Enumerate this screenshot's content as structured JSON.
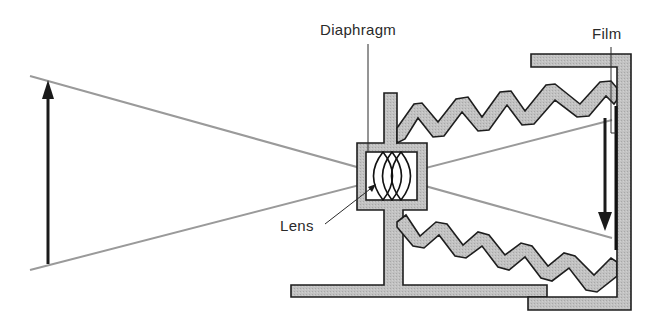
{
  "diagram": {
    "labels": {
      "diaphragm": "Diaphragm",
      "film": "Film",
      "lens": "Lens"
    },
    "elements": {
      "object_arrow": {
        "direction": "up",
        "x": 48,
        "y_top": 80,
        "y_bottom": 264
      },
      "image_arrow": {
        "direction": "down",
        "x": 605,
        "y_top": 116,
        "y_bottom": 232
      },
      "rays": [
        {
          "from": [
            30,
            76
          ],
          "to": [
            612,
            238
          ]
        },
        {
          "from": [
            30,
            270
          ],
          "to": [
            612,
            120
          ]
        }
      ],
      "lens_elements": 3,
      "bellows_folds": 5
    },
    "colors": {
      "body_fill": "#bdbdbd",
      "outline": "#1e1e1e",
      "ray": "#9a9a9a",
      "arrow": "#1a1a1a",
      "text": "#2a2a2a",
      "background": "#ffffff"
    }
  }
}
